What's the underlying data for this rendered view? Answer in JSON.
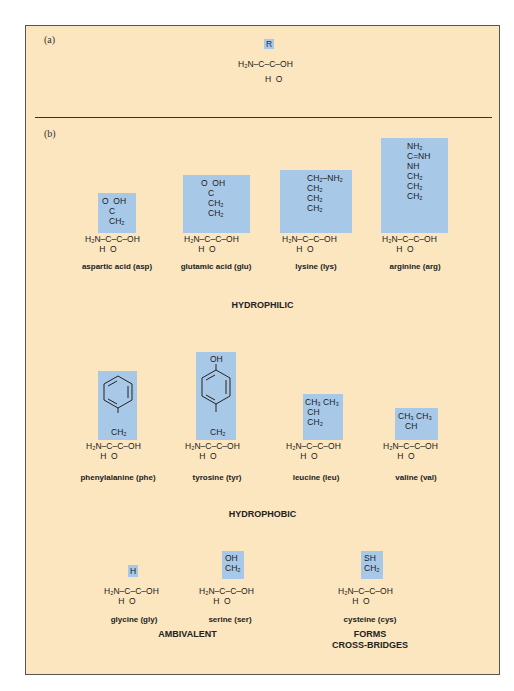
{
  "panels": {
    "a": {
      "label": "(a)"
    },
    "b": {
      "label": "(b)"
    }
  },
  "general": {
    "r": "R",
    "backbone": "H₂N–C–C–OH",
    "h": "H",
    "o": "O"
  },
  "hydrophilic": {
    "title": "HYDROPHILIC",
    "items": [
      {
        "name": "aspartic acid (asp)",
        "side_chain": [
          "O=C–OH",
          "CH₂"
        ]
      },
      {
        "name": "glutamic acid (glu)",
        "side_chain": [
          "O=C–OH",
          "CH₂",
          "CH₂"
        ]
      },
      {
        "name": "lysine (lys)",
        "side_chain": [
          "CH₂–NH₂",
          "CH₂",
          "CH₂",
          "CH₂"
        ]
      },
      {
        "name": "arginine (arg)",
        "side_chain": [
          "NH₂",
          "C=NH",
          "NH",
          "CH₂",
          "CH₂",
          "CH₂"
        ]
      }
    ]
  },
  "hydrophobic": {
    "title": "HYDROPHOBIC",
    "items": [
      {
        "name": "phenylalanine (phe)",
        "side_chain": [
          "benzene ring",
          "CH₂"
        ]
      },
      {
        "name": "tyrosine (tyr)",
        "side_chain": [
          "OH",
          "benzene ring",
          "CH₂"
        ]
      },
      {
        "name": "leucine (leu)",
        "side_chain": [
          "CH₃ CH₃",
          "CH",
          "CH₂"
        ]
      },
      {
        "name": "valine (val)",
        "side_chain": [
          "CH₃ CH₃",
          "CH"
        ]
      }
    ]
  },
  "ambivalent": {
    "title": "AMBIVALENT",
    "items": [
      {
        "name": "glycine (gly)",
        "side_chain": [
          "H"
        ]
      },
      {
        "name": "serine (ser)",
        "side_chain": [
          "OH",
          "CH₂"
        ]
      }
    ]
  },
  "cross_bridges": {
    "title": "FORMS\nCROSS-BRIDGES",
    "items": [
      {
        "name": "cysteine (cys)",
        "side_chain": [
          "SH",
          "CH₂"
        ]
      }
    ]
  },
  "colors": {
    "background": "#fbe6bf",
    "highlight": "#a8c8e8"
  }
}
